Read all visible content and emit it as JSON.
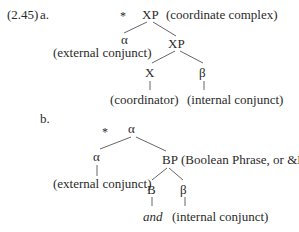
{
  "example": {
    "number": "(2.45)",
    "a": {
      "label": "a.",
      "star": "*",
      "root": "XP",
      "root_note": "(coordinate complex)",
      "left_node": "α",
      "left_note": "(external conjunct)",
      "right_node": "XP",
      "x_node": "X",
      "x_note": "(coordinator)",
      "beta_node": "β",
      "beta_note": "(internal conjunct)"
    },
    "b": {
      "label": "b.",
      "star": "*",
      "root": "α",
      "left_node": "α",
      "left_note": "(external conjunct)",
      "right_node": "BP",
      "right_note": "(Boolean Phrase, or &P)",
      "b_node": "B",
      "b_word": "and",
      "beta_node": "β",
      "beta_note": "(internal conjunct)"
    }
  }
}
